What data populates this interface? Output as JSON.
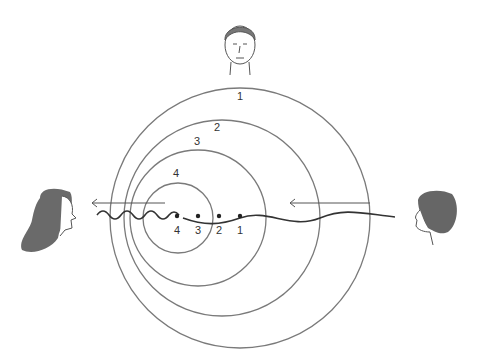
{
  "diagram": {
    "circle_labels": [
      "1",
      "2",
      "3",
      "4"
    ],
    "source_position_labels": [
      "4",
      "3",
      "2",
      "1"
    ],
    "observers": {
      "top": "neutral observer (front view)",
      "left": "observer ahead (higher frequency)",
      "right": "observer behind (lower frequency)"
    },
    "colors": {
      "line": "#7a7a7a",
      "wave": "#333333"
    }
  }
}
